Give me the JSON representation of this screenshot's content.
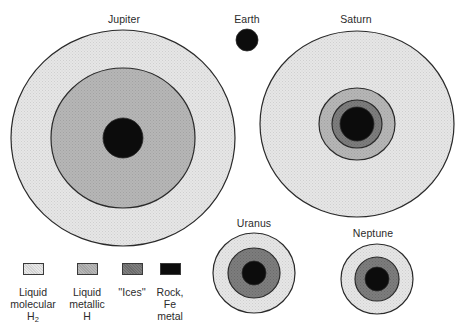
{
  "diagram": {
    "type": "planetary interior structure comparison",
    "canvas": {
      "width": 466,
      "height": 331,
      "background": "#ffffff"
    }
  },
  "layers": {
    "molecular_h2": {
      "label_lines": [
        "Liquid",
        "molecular",
        "H"
      ],
      "subscript": "2",
      "color": "#e3e3e3"
    },
    "metallic_h": {
      "label_lines": [
        "Liquid",
        "metallic",
        "H"
      ],
      "color": "#b3b3b3"
    },
    "ices": {
      "label_lines": [
        "''Ices''"
      ],
      "color": "#7b7b7b"
    },
    "rock": {
      "label_lines": [
        "Rock,",
        "Fe",
        "metal"
      ],
      "color": "#0c0c0c"
    }
  },
  "outline_color": "#2a2a2a",
  "planets": [
    {
      "name": "Jupiter",
      "label_pos": [
        124,
        13
      ],
      "cx": 123,
      "cy": 138,
      "shells": [
        {
          "layer": "molecular_h2",
          "rx": 112,
          "ry": 108
        },
        {
          "layer": "metallic_h",
          "rx": 72,
          "ry": 70
        },
        {
          "layer": "rock",
          "rx": 20,
          "ry": 20
        }
      ]
    },
    {
      "name": "Earth",
      "label_pos": [
        247,
        13
      ],
      "cx": 247,
      "cy": 40,
      "shells": [
        {
          "layer": "rock",
          "rx": 11,
          "ry": 11
        }
      ]
    },
    {
      "name": "Saturn",
      "label_pos": [
        356,
        13
      ],
      "cx": 357,
      "cy": 124,
      "shells": [
        {
          "layer": "molecular_h2",
          "rx": 97,
          "ry": 93
        },
        {
          "layer": "metallic_h",
          "rx": 38,
          "ry": 36
        },
        {
          "layer": "ices",
          "rx": 25,
          "ry": 24
        },
        {
          "layer": "rock",
          "rx": 17,
          "ry": 17
        }
      ]
    },
    {
      "name": "Uranus",
      "label_pos": [
        254,
        217
      ],
      "cx": 254,
      "cy": 273,
      "shells": [
        {
          "layer": "molecular_h2",
          "rx": 41,
          "ry": 40
        },
        {
          "layer": "ices",
          "rx": 26,
          "ry": 25
        },
        {
          "layer": "rock",
          "rx": 12,
          "ry": 12
        }
      ]
    },
    {
      "name": "Neptune",
      "label_pos": [
        373,
        227
      ],
      "cx": 377,
      "cy": 279,
      "shells": [
        {
          "layer": "molecular_h2",
          "rx": 36,
          "ry": 35
        },
        {
          "layer": "ices",
          "rx": 22,
          "ry": 22
        },
        {
          "layer": "rock",
          "rx": 12,
          "ry": 12
        }
      ]
    }
  ],
  "legend": {
    "items": [
      {
        "layer": "molecular_h2",
        "x": 33,
        "y": 263,
        "lines": [
          "Liquid",
          "molecular",
          "H"
        ],
        "subscript": "2"
      },
      {
        "layer": "metallic_h",
        "x": 87,
        "y": 263,
        "lines": [
          "Liquid",
          "metallic",
          "H"
        ]
      },
      {
        "layer": "ices",
        "x": 132,
        "y": 263,
        "lines": [
          "''Ices''"
        ]
      },
      {
        "layer": "rock",
        "x": 170,
        "y": 263,
        "lines": [
          "Rock,",
          "Fe",
          "metal"
        ]
      }
    ]
  }
}
